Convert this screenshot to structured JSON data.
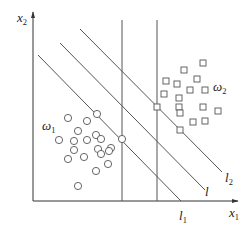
{
  "diagram": {
    "type": "linear-classifier-margin",
    "axes": {
      "x_label": "x",
      "x_sub": "1",
      "y_label": "x",
      "y_sub": "2",
      "origin": [
        33,
        201
      ],
      "x_end": 238,
      "y_end": 12
    },
    "classes": [
      {
        "label": "ω",
        "sub": "1",
        "pos": [
          42,
          130
        ],
        "marker": "circle"
      },
      {
        "label": "ω",
        "sub": "2",
        "pos": [
          213,
          91
        ],
        "marker": "square"
      }
    ],
    "lines": [
      {
        "name": "l1",
        "label": "l",
        "sub": "1",
        "x1": 38,
        "y1": 55,
        "x2": 181,
        "y2": 201,
        "label_pos": [
          179,
          220
        ]
      },
      {
        "name": "l",
        "label": "l",
        "sub": "",
        "x1": 60,
        "y1": 43,
        "x2": 205,
        "y2": 190,
        "label_pos": [
          205,
          196
        ]
      },
      {
        "name": "l2",
        "label": "l",
        "sub": "2",
        "x1": 80,
        "y1": 29,
        "x2": 222,
        "y2": 172,
        "label_pos": [
          225,
          182
        ]
      }
    ],
    "vertical_lines": [
      {
        "x": 122,
        "y1": 20,
        "y2": 201
      },
      {
        "x": 157,
        "y1": 20,
        "y2": 201
      }
    ],
    "circles": [
      [
        97,
        114
      ],
      [
        68,
        118
      ],
      [
        87,
        121
      ],
      [
        78,
        131
      ],
      [
        96,
        135
      ],
      [
        59,
        140
      ],
      [
        74,
        141
      ],
      [
        87,
        140
      ],
      [
        101,
        139
      ],
      [
        122,
        139
      ],
      [
        74,
        150
      ],
      [
        98,
        149
      ],
      [
        111,
        148
      ],
      [
        68,
        159
      ],
      [
        84,
        157
      ],
      [
        101,
        154
      ],
      [
        109,
        151
      ],
      [
        96,
        171
      ],
      [
        108,
        164
      ],
      [
        78,
        186
      ]
    ],
    "squares": [
      [
        203,
        63
      ],
      [
        184,
        70
      ],
      [
        197,
        79
      ],
      [
        166,
        81
      ],
      [
        177,
        84
      ],
      [
        190,
        90
      ],
      [
        205,
        90
      ],
      [
        164,
        94
      ],
      [
        179,
        98
      ],
      [
        157,
        107
      ],
      [
        179,
        107
      ],
      [
        203,
        107
      ],
      [
        180,
        113
      ],
      [
        218,
        111
      ],
      [
        193,
        122
      ],
      [
        205,
        121
      ],
      [
        180,
        130
      ]
    ]
  }
}
